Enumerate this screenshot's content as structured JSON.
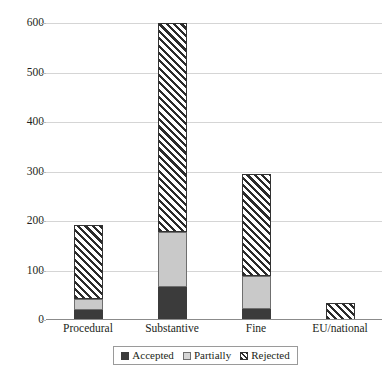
{
  "chart_data": {
    "type": "bar",
    "subtype": "stacked-bar",
    "title": "",
    "xlabel": "",
    "ylabel": "",
    "categories": [
      "Procedural",
      "Substantive",
      "Fine",
      "EU/national"
    ],
    "series": [
      {
        "name": "Accepted",
        "values": [
          20,
          67,
          22,
          0
        ],
        "color": "#3b3b3b",
        "pattern": "solid-dark"
      },
      {
        "name": "Partially",
        "values": [
          22,
          111,
          67,
          0
        ],
        "color": "#c9c9c9",
        "pattern": "solid-light"
      },
      {
        "name": "Rejected",
        "values": [
          150,
          422,
          206,
          34
        ],
        "color": "#ffffff",
        "pattern": "diagonal-hatch"
      }
    ],
    "totals": [
      192,
      600,
      295,
      34
    ],
    "ylim": [
      0,
      600
    ],
    "yticks": [
      0,
      100,
      200,
      300,
      400,
      500,
      600
    ],
    "ytick_labels": [
      "0",
      "100",
      "200",
      "300",
      "400",
      "500",
      "600"
    ],
    "grid": true,
    "grid_axis": "y",
    "legend_position": "bottom",
    "legend_entries": [
      "Accepted",
      "Partially",
      "Rejected"
    ]
  },
  "axis": {
    "y_labels": [
      "600",
      "500",
      "400",
      "300",
      "200",
      "100",
      "0"
    ],
    "x_labels": [
      "Procedural",
      "Substantive",
      "Fine",
      "EU/national"
    ]
  },
  "legend": {
    "items": [
      {
        "label": "Accepted"
      },
      {
        "label": "Partially"
      },
      {
        "label": "Rejected"
      }
    ]
  },
  "colors": {
    "accepted": "#3b3b3b",
    "partially": "#c9c9c9",
    "rejected_hatch": "#2b2b2b",
    "gridline": "#d5d5d5",
    "axis": "#8b8b8b",
    "text": "#231f20"
  }
}
